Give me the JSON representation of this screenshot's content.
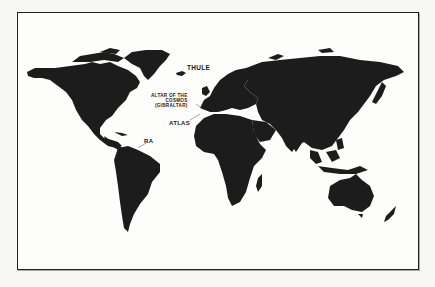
{
  "map": {
    "type": "world map silhouette",
    "land_color": "#1c1c1c",
    "ocean_color": "#fdfdfc",
    "frame_color": "#222222",
    "labels": [
      {
        "id": "thule",
        "text": "THULE"
      },
      {
        "id": "altar",
        "lines": [
          "ALTAR OF THE",
          "COSMOS",
          "(GIBRALTAR)"
        ]
      },
      {
        "id": "atlas",
        "text": "ATLAS"
      },
      {
        "id": "ra",
        "text": "RA"
      }
    ]
  }
}
